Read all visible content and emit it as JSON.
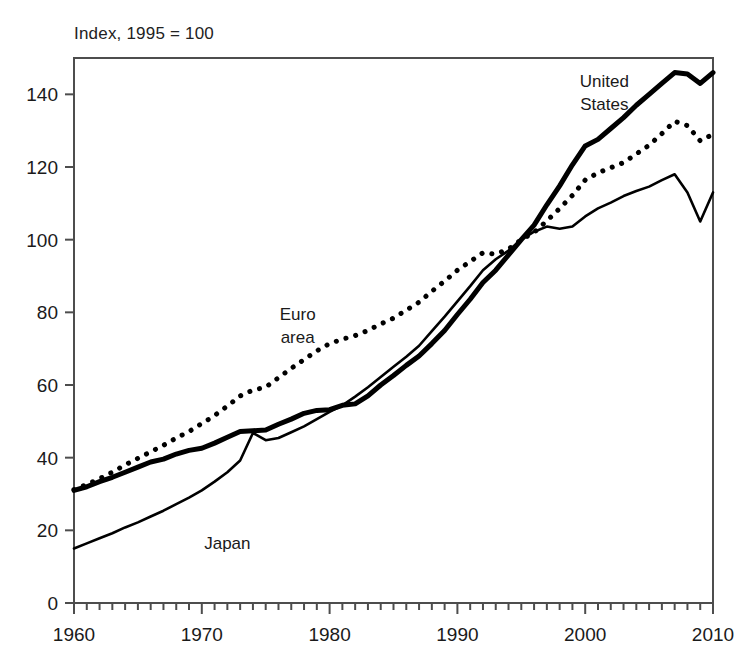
{
  "chart_data": {
    "type": "line",
    "title": "Index, 1995 = 100",
    "subtitle": "",
    "xlabel": "",
    "ylabel": "",
    "xlim": [
      1960,
      2010
    ],
    "ylim": [
      0,
      150
    ],
    "yticks": [
      0,
      20,
      40,
      60,
      80,
      100,
      120,
      140
    ],
    "ytick_labels": [
      "0",
      "20",
      "40",
      "60",
      "80",
      "100",
      "120",
      "140"
    ],
    "xticks": [
      1960,
      1970,
      1980,
      1990,
      2000,
      2010
    ],
    "xtick_labels": [
      "1960",
      "1970",
      "1980",
      "1990",
      "2000",
      "2010"
    ],
    "x_minor_tick_interval": 1,
    "grid": false,
    "legend_position": "inline-annotations",
    "frame": "box",
    "x": [
      1960,
      1961,
      1962,
      1963,
      1964,
      1965,
      1966,
      1967,
      1968,
      1969,
      1970,
      1971,
      1972,
      1973,
      1974,
      1975,
      1976,
      1977,
      1978,
      1979,
      1980,
      1981,
      1982,
      1983,
      1984,
      1985,
      1986,
      1987,
      1988,
      1989,
      1990,
      1991,
      1992,
      1993,
      1994,
      1995,
      1996,
      1997,
      1998,
      1999,
      2000,
      2001,
      2002,
      2003,
      2004,
      2005,
      2006,
      2007,
      2008,
      2009,
      2010
    ],
    "series": [
      {
        "name": "United States",
        "label": "United States",
        "label_lines": [
          "United",
          "States"
        ],
        "style": "thick-solid",
        "color": "#000000",
        "line_width": 5,
        "values": [
          31.0,
          32.0,
          33.4,
          34.6,
          36.0,
          37.4,
          38.8,
          39.6,
          41.0,
          42.0,
          42.6,
          44.0,
          45.6,
          47.2,
          47.4,
          47.6,
          49.2,
          50.6,
          52.2,
          53.0,
          53.2,
          54.4,
          54.8,
          57.0,
          60.0,
          62.6,
          65.4,
          68.0,
          71.4,
          75.0,
          79.4,
          83.6,
          88.2,
          91.6,
          95.8,
          100.0,
          104.0,
          109.6,
          114.8,
          120.6,
          125.8,
          127.6,
          130.6,
          133.6,
          137.0,
          140.0,
          143.0,
          146.0,
          145.6,
          143.0,
          146.0
        ]
      },
      {
        "name": "Euro area",
        "label": "Euro area",
        "label_lines": [
          "Euro",
          "area"
        ],
        "style": "dotted",
        "color": "#000000",
        "line_width": 5,
        "values": [
          31.2,
          32.6,
          34.2,
          36.0,
          38.0,
          39.8,
          41.6,
          43.4,
          45.4,
          47.2,
          49.4,
          51.6,
          54.2,
          57.0,
          58.6,
          59.4,
          62.0,
          64.6,
          67.0,
          69.4,
          71.4,
          72.6,
          73.6,
          75.0,
          76.8,
          78.4,
          80.6,
          82.8,
          85.8,
          88.6,
          91.6,
          94.0,
          96.4,
          96.0,
          97.4,
          100.0,
          102.0,
          105.2,
          108.6,
          112.2,
          116.4,
          118.4,
          119.8,
          121.2,
          123.6,
          126.0,
          129.2,
          132.6,
          131.4,
          127.2,
          129.0
        ]
      },
      {
        "name": "Japan",
        "label": "Japan",
        "label_lines": [
          "Japan"
        ],
        "style": "thin-solid",
        "color": "#000000",
        "line_width": 2.6,
        "values": [
          15.0,
          16.4,
          17.8,
          19.2,
          20.8,
          22.2,
          23.8,
          25.4,
          27.2,
          29.0,
          31.0,
          33.4,
          36.0,
          39.2,
          46.8,
          44.8,
          45.4,
          47.0,
          48.6,
          50.6,
          52.6,
          54.4,
          56.8,
          59.4,
          62.2,
          65.0,
          67.8,
          70.8,
          74.8,
          78.8,
          83.0,
          87.2,
          91.6,
          94.6,
          97.0,
          100.0,
          102.2,
          103.6,
          103.0,
          103.6,
          106.4,
          108.6,
          110.2,
          112.0,
          113.4,
          114.6,
          116.4,
          118.0,
          113.0,
          105.0,
          113.0
        ]
      }
    ],
    "annotations": [
      {
        "text": "United States",
        "x": 2001.5,
        "y": 142,
        "align": "center"
      },
      {
        "text": "Euro area",
        "x": 1977.5,
        "y": 78,
        "align": "center"
      },
      {
        "text": "Japan",
        "x": 1972.0,
        "y": 15,
        "align": "center"
      }
    ]
  }
}
